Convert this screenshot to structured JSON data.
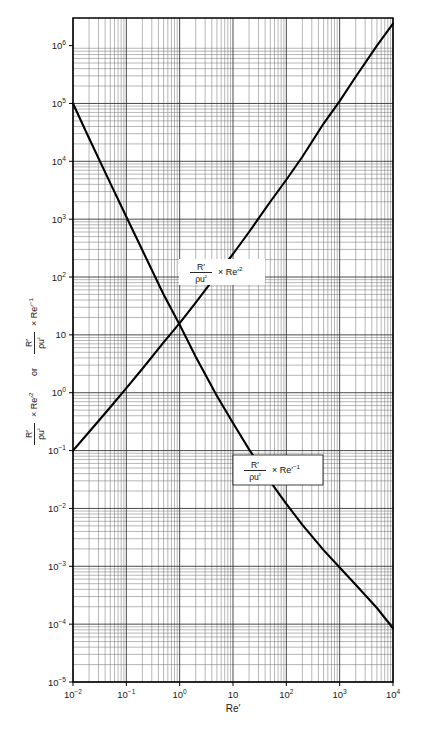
{
  "chart_data": {
    "type": "line",
    "title": "",
    "subtitle": "",
    "xlabel": "Re′",
    "ylabel": "R′/ρu² × Re′² or R′/ρu² × Re′⁻¹",
    "xscale": "log",
    "yscale": "log",
    "xlim": [
      0.01,
      10000
    ],
    "ylim": [
      1e-05,
      3000000
    ],
    "grid": true,
    "grid_style": "log-log graph paper, major decade lines plus minor 2-9 lines",
    "legend": "none",
    "x_tick_labels": [
      "10⁻²",
      "10⁻¹",
      "10⁰",
      "10",
      "10²",
      "10³",
      "10⁴"
    ],
    "x_tick_values": [
      0.01,
      0.1,
      1,
      10,
      100,
      1000,
      10000
    ],
    "y_tick_labels": [
      "10⁶",
      "10⁵",
      "10⁴",
      "10³",
      "10²",
      "10",
      "10⁰",
      "10⁻¹",
      "10⁻²",
      "10⁻³",
      "10⁻⁴",
      "10⁻⁵"
    ],
    "y_tick_values": [
      1000000,
      100000,
      10000,
      1000,
      100,
      10,
      1,
      0.1,
      0.01,
      0.001,
      0.0001,
      1e-05
    ],
    "series": [
      {
        "name": "R'/(ρu²) × Re'²",
        "label": "ascending",
        "x": [
          0.01,
          0.02,
          0.05,
          0.1,
          0.2,
          0.5,
          1,
          2,
          5,
          10,
          20,
          50,
          100,
          200,
          500,
          1000,
          2000,
          5000,
          10000
        ],
        "y": [
          0.1,
          0.21,
          0.56,
          1.2,
          2.6,
          7.4,
          16,
          36,
          110,
          250,
          600,
          2000,
          4800,
          12000,
          45000,
          110000,
          290000,
          1000000,
          2400000
        ]
      },
      {
        "name": "R'/(ρu²) × Re'⁻¹",
        "label": "descending",
        "x": [
          0.01,
          0.02,
          0.05,
          0.1,
          0.2,
          0.5,
          1,
          2,
          5,
          10,
          20,
          50,
          100,
          200,
          500,
          1000,
          2000,
          5000,
          10000
        ],
        "y": [
          100000,
          25000,
          4200,
          1100,
          290,
          50,
          15,
          4.2,
          0.88,
          0.3,
          0.105,
          0.029,
          0.012,
          0.0052,
          0.0019,
          0.00095,
          0.00048,
          0.00019,
          8.5e-05
        ]
      }
    ],
    "annotations": [
      {
        "id": "ann-upper",
        "text": "R′/ρu² × Re′²",
        "numerator": "R′",
        "denominator": "ρu²",
        "multiplier": "× Re′",
        "exponent": "2",
        "boxed": false
      },
      {
        "id": "ann-lower",
        "text": "R′/ρu² × Re′⁻¹",
        "numerator": "R′",
        "denominator": "ρu²",
        "multiplier": "× Re′",
        "exponent": "−1",
        "boxed": true
      }
    ]
  },
  "axes": {
    "x_title": "Re′",
    "y_title_parts": {
      "num1": "R′",
      "den1": "ρu²",
      "mul1": "× Re′",
      "exp1": "2",
      "conj": "or",
      "num2": "R′",
      "den2": "ρu²",
      "mul2": "× Re′",
      "exp2": "−1"
    }
  },
  "ticks": {
    "x": [
      {
        "label": "10",
        "sup": "−2",
        "value": 0.01
      },
      {
        "label": "10",
        "sup": "−1",
        "value": 0.1
      },
      {
        "label": "10",
        "sup": "0",
        "value": 1
      },
      {
        "label": "10",
        "sup": "",
        "value": 10
      },
      {
        "label": "10",
        "sup": "2",
        "value": 100
      },
      {
        "label": "10",
        "sup": "3",
        "value": 1000
      },
      {
        "label": "10",
        "sup": "4",
        "value": 10000
      }
    ],
    "y": [
      {
        "label": "10",
        "sup": "6",
        "value": 1000000
      },
      {
        "label": "10",
        "sup": "5",
        "value": 100000
      },
      {
        "label": "10",
        "sup": "4",
        "value": 10000
      },
      {
        "label": "10",
        "sup": "3",
        "value": 1000
      },
      {
        "label": "10",
        "sup": "2",
        "value": 100
      },
      {
        "label": "10",
        "sup": "",
        "value": 10
      },
      {
        "label": "10",
        "sup": "0",
        "value": 1
      },
      {
        "label": "10",
        "sup": "−1",
        "value": 0.1
      },
      {
        "label": "10",
        "sup": "−2",
        "value": 0.01
      },
      {
        "label": "10",
        "sup": "−3",
        "value": 0.001
      },
      {
        "label": "10",
        "sup": "−4",
        "value": 0.0001
      },
      {
        "label": "10",
        "sup": "−5",
        "value": 1e-05
      }
    ]
  },
  "colors": {
    "curve": "#000000",
    "grid_major": "#2b2b2b",
    "grid_minor": "#6e6e6e",
    "frame": "#000000",
    "background": "#ffffff",
    "text": "#1a1a1a"
  }
}
